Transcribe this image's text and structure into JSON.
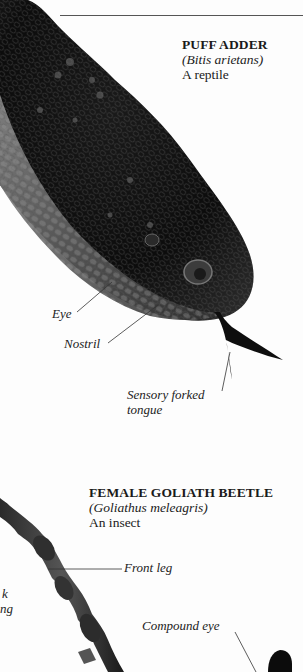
{
  "snake": {
    "name": "PUFF ADDER",
    "latin": "(Bitis arietans)",
    "type": "A reptile",
    "labels": {
      "eye": "Eye",
      "nostril": "Nostril",
      "tongue_line1": "Sensory forked",
      "tongue_line2": "tongue"
    }
  },
  "beetle": {
    "name": "FEMALE GOLIATH BEETLE",
    "latin": "(Goliathus meleagris)",
    "type": "An insect",
    "labels": {
      "front_leg": "Front leg",
      "compound_eye": "Compound eye",
      "cut_label_line1": "k",
      "cut_label_line2": "ng"
    }
  },
  "colors": {
    "background": "#fdfdfd",
    "text": "#1a1a1a",
    "snake_dark": "#0c0c0c",
    "snake_mid": "#3a3a3a",
    "snake_light": "#7a7a7a",
    "leader_line": "#333333"
  }
}
